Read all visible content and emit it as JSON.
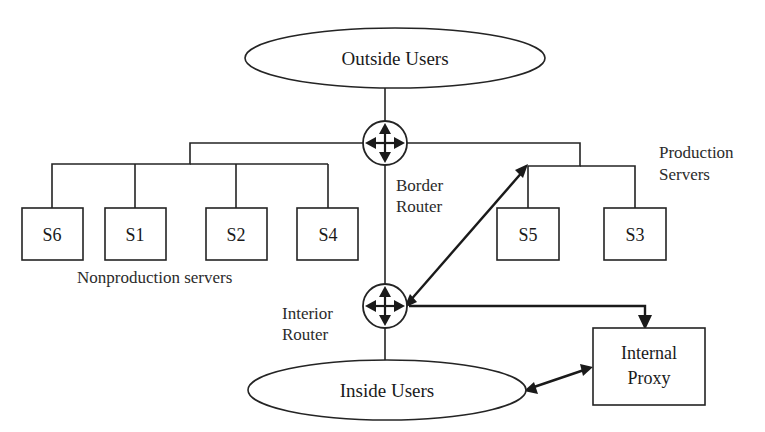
{
  "diagram": {
    "background_color": "#ffffff",
    "line_color": "#242424",
    "text_color": "#1a1a1a"
  },
  "nodes": {
    "outside_users": {
      "label": "Outside Users",
      "shape": "ellipse",
      "cx": 395,
      "cy": 58,
      "rx": 150,
      "ry": 30
    },
    "inside_users": {
      "label": "Inside Users",
      "shape": "ellipse",
      "cx": 387,
      "cy": 390,
      "rx": 139,
      "ry": 30
    },
    "internal_proxy": {
      "label_line1": "Internal",
      "label_line2": "Proxy",
      "shape": "rect",
      "x": 593,
      "y": 328,
      "w": 112,
      "h": 77
    },
    "border_router": {
      "label_line1": "Border",
      "label_line2": "Router",
      "shape": "router",
      "cx": 385,
      "cy": 143,
      "r": 22
    },
    "interior_router": {
      "label_line1": "Interior",
      "label_line2": "Router",
      "shape": "router",
      "cx": 385,
      "cy": 306,
      "r": 22
    }
  },
  "servers": {
    "nonproduction": {
      "group_label": "Nonproduction servers",
      "items": [
        {
          "label": "S6",
          "x": 22,
          "y": 208,
          "w": 61,
          "h": 52
        },
        {
          "label": "S1",
          "x": 105,
          "y": 208,
          "w": 61,
          "h": 52
        },
        {
          "label": "S2",
          "x": 206,
          "y": 208,
          "w": 61,
          "h": 52
        },
        {
          "label": "S4",
          "x": 297,
          "y": 208,
          "w": 61,
          "h": 52
        }
      ]
    },
    "production": {
      "group_label_line1": "Production",
      "group_label_line2": "Servers",
      "items": [
        {
          "label": "S5",
          "x": 497,
          "y": 208,
          "w": 62,
          "h": 52
        },
        {
          "label": "S3",
          "x": 604,
          "y": 208,
          "w": 62,
          "h": 52
        }
      ]
    }
  },
  "connections": [
    {
      "name": "outside-users-to-border-router",
      "kind": "line"
    },
    {
      "name": "border-router-to-interior-router",
      "kind": "line"
    },
    {
      "name": "border-router-to-nonproduction-bus",
      "kind": "bus"
    },
    {
      "name": "border-router-to-production-bus",
      "kind": "bus"
    },
    {
      "name": "interior-router-to-s5",
      "kind": "double-arrow"
    },
    {
      "name": "interior-router-to-internal-proxy",
      "kind": "arrow"
    },
    {
      "name": "inside-users-to-internal-proxy",
      "kind": "double-arrow"
    },
    {
      "name": "interior-router-to-inside-users",
      "kind": "line"
    }
  ]
}
